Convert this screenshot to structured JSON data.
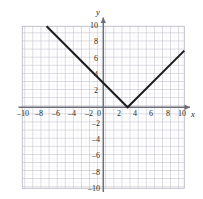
{
  "figure": {
    "background_color": "#ffffff",
    "grid_color": "#b9b9c4",
    "minor_grid_color": "#d6d6de",
    "axis_color": "#6d6d78",
    "curve_color": "#1c1c1c"
  },
  "axes": {
    "x_name": "x",
    "y_name": "y",
    "x_ticks": [
      -10,
      -8,
      -6,
      -4,
      -2,
      0,
      2,
      4,
      6,
      8,
      10
    ],
    "y_ticks": [
      10,
      8,
      6,
      4,
      2,
      -2,
      -4,
      -6,
      -8,
      -10
    ],
    "origin_label": "0",
    "x_tick_labels": [
      "–10",
      "–8",
      "–6",
      "–4",
      "–2",
      "0",
      "2",
      "4",
      "6",
      "8",
      "10"
    ],
    "y_tick_labels": [
      "10",
      "8",
      "6",
      "4",
      "2",
      "–2",
      "–4",
      "–6",
      "–8",
      "–10"
    ]
  },
  "chart_data": {
    "type": "line",
    "title": "",
    "xlabel": "x",
    "ylabel": "y",
    "xlim": [
      -10.5,
      10.5
    ],
    "ylim": [
      -10.5,
      10.5
    ],
    "grid": true,
    "minor_grid_step": 0.5,
    "major_grid_step": 1,
    "tick_step": 2,
    "legend": null,
    "series": [
      {
        "name": "y = |x - 3|",
        "equation": "y = |x − 3|",
        "vertex": [
          3,
          0
        ],
        "x": [
          -7,
          3,
          10
        ],
        "values": [
          10,
          0,
          7
        ],
        "points": [
          [
            -7,
            10
          ],
          [
            3,
            0
          ],
          [
            10,
            7
          ]
        ],
        "left_slope": -1,
        "right_slope": 1,
        "y_intercept": 3,
        "color": "#1c1c1c",
        "linewidth": 2
      }
    ]
  }
}
